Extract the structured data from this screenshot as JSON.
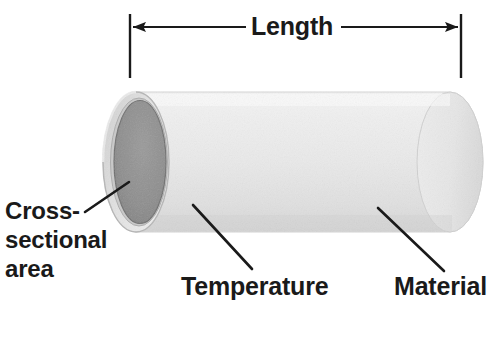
{
  "figure": {
    "kind": "technical-illustration",
    "background_color": "#ffffff",
    "text_color": "#1a1a1a"
  },
  "dimension": {
    "label": "Length",
    "arrow_left_x": 130,
    "arrow_right_x": 461,
    "arrow_y": 27,
    "extension_top_y": 14,
    "extension_bottom_y": 78,
    "line_color": "#1a1a1a"
  },
  "callouts": [
    {
      "id": "cross-sectional-area",
      "lines": [
        "Cross-",
        "sectional",
        "area"
      ],
      "text": "Cross-sectional area",
      "leader": {
        "x1": 85,
        "y1": 212,
        "x2": 129,
        "y2": 182
      }
    },
    {
      "id": "temperature",
      "lines": [
        "Temperature"
      ],
      "text": "Temperature",
      "leader": {
        "x1": 193,
        "y1": 205,
        "x2": 252,
        "y2": 269
      }
    },
    {
      "id": "material",
      "lines": [
        "Material"
      ],
      "text": "Material",
      "leader": {
        "x1": 378,
        "y1": 208,
        "x2": 444,
        "y2": 271
      }
    }
  ],
  "cylinder": {
    "body_color_light": "#f2f2f2",
    "body_color_mid": "#e4e4e4",
    "body_color_shadow": "#d2d2d2",
    "rim_color": "#dcdcdc",
    "rim_outline_color": "#b4b4b4",
    "cross_section_color": "#8e8e8e",
    "cross_section_dark": "#7a7a7a",
    "left_x": 103,
    "right_x": 483,
    "top_y": 92,
    "bottom_y": 231,
    "cap_rx": 33,
    "cap_ry": 70
  }
}
